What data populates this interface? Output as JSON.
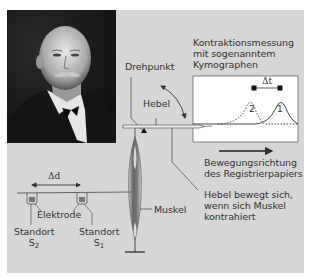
{
  "figure": {
    "background_color": "#d6d6d6",
    "portrait": {
      "subject": "portrait-photo",
      "style": "black-and-white"
    },
    "labels": {
      "kymograph_title_line1": "Kontraktionsmessung",
      "kymograph_title_line2": "mit sogenanntem",
      "kymograph_title_line3": "Kymographen",
      "pivot": "Drehpunkt",
      "lever": "Hebel",
      "delta_t": "Δt",
      "curve_1": "1",
      "curve_2": "2",
      "paper_direction_line1": "Bewegungsrichtung",
      "paper_direction_line2": "des Registrierpapiers",
      "lever_note_line1": "Hebel bewegt sich,",
      "lever_note_line2": "wenn sich Muskel",
      "lever_note_line3": "kontrahiert",
      "delta_d": "Δd",
      "electrode": "Elektrode",
      "muscle": "Muskel",
      "site_2_label": "Standort",
      "site_2_symbol": "S",
      "site_2_index": "2",
      "site_1_label": "Standort",
      "site_1_symbol": "S",
      "site_1_index": "1"
    },
    "colors": {
      "line": "#333333",
      "text": "#333333",
      "kymograph_paper": "#ffffff",
      "muscle": "#6e6e6e"
    }
  }
}
